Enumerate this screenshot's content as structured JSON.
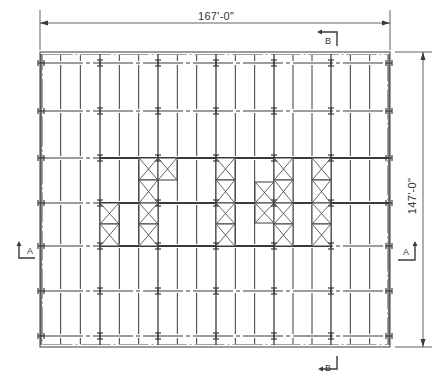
{
  "drawing": {
    "title": "Structural framing plan",
    "dimensions": {
      "width_label": "167'-0\"",
      "height_label": "147'-0\""
    },
    "section_markers": [
      {
        "id": "sec-b-top",
        "label": "B"
      },
      {
        "id": "sec-b-bottom",
        "label": "B"
      },
      {
        "id": "sec-a-left",
        "label": "A"
      },
      {
        "id": "sec-a-right",
        "label": "A"
      }
    ],
    "colors": {
      "line": "#3a3a3a",
      "light_line": "#8a8a8a",
      "background": "#ffffff"
    },
    "frame": {
      "left": 40,
      "right": 390,
      "top": 52,
      "bottom": 347
    },
    "column_lines_x": [
      41,
      100,
      158,
      216,
      274,
      331,
      389
    ],
    "row_lines_y": [
      63,
      111,
      158,
      203,
      246,
      291,
      336
    ],
    "joists_per_bay": 2,
    "braced_cells": [
      {
        "x": 139,
        "y": 158,
        "w": 19,
        "h": 22
      },
      {
        "x": 139,
        "y": 180,
        "w": 19,
        "h": 23
      },
      {
        "x": 139,
        "y": 203,
        "w": 19,
        "h": 21
      },
      {
        "x": 139,
        "y": 224,
        "w": 19,
        "h": 22
      },
      {
        "x": 100,
        "y": 203,
        "w": 19,
        "h": 21
      },
      {
        "x": 100,
        "y": 224,
        "w": 19,
        "h": 22
      },
      {
        "x": 158,
        "y": 158,
        "w": 19,
        "h": 22
      },
      {
        "x": 216,
        "y": 158,
        "w": 19,
        "h": 22
      },
      {
        "x": 216,
        "y": 180,
        "w": 19,
        "h": 23
      },
      {
        "x": 216,
        "y": 203,
        "w": 19,
        "h": 21
      },
      {
        "x": 216,
        "y": 224,
        "w": 19,
        "h": 22
      },
      {
        "x": 255,
        "y": 182,
        "w": 19,
        "h": 21
      },
      {
        "x": 255,
        "y": 203,
        "w": 19,
        "h": 20
      },
      {
        "x": 274,
        "y": 158,
        "w": 19,
        "h": 22
      },
      {
        "x": 274,
        "y": 180,
        "w": 19,
        "h": 23
      },
      {
        "x": 274,
        "y": 203,
        "w": 19,
        "h": 21
      },
      {
        "x": 274,
        "y": 224,
        "w": 19,
        "h": 22
      },
      {
        "x": 312,
        "y": 158,
        "w": 19,
        "h": 22
      },
      {
        "x": 312,
        "y": 180,
        "w": 19,
        "h": 23
      },
      {
        "x": 312,
        "y": 203,
        "w": 19,
        "h": 21
      },
      {
        "x": 312,
        "y": 224,
        "w": 19,
        "h": 22
      }
    ],
    "heavy_beams": [
      {
        "x1": 100,
        "x2": 389,
        "y": 158
      },
      {
        "x1": 100,
        "x2": 389,
        "y": 203
      },
      {
        "x1": 100,
        "x2": 331,
        "y": 246
      }
    ]
  }
}
